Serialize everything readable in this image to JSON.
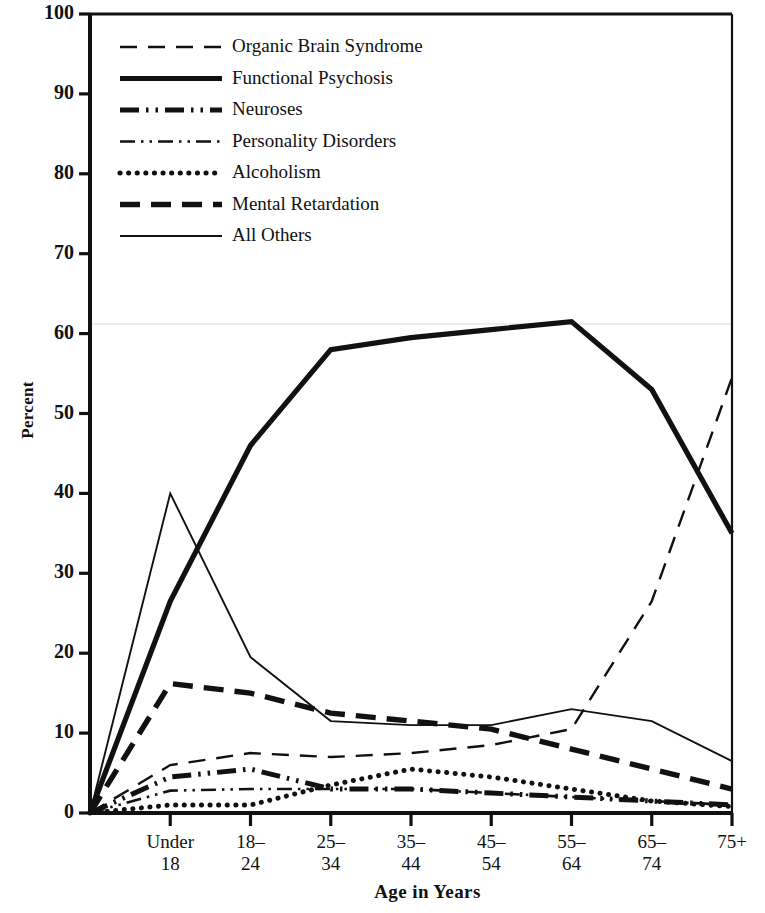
{
  "chart_data": {
    "type": "line",
    "title": "",
    "xlabel": "Age in Years",
    "ylabel": "Percent",
    "ylim": [
      0,
      100
    ],
    "yticks": [
      0,
      10,
      20,
      30,
      40,
      50,
      60,
      70,
      80,
      90,
      100
    ],
    "grid": false,
    "legend_position": "upper left",
    "categories": [
      "",
      "Under 18",
      "18–24",
      "25–34",
      "35–44",
      "45–54",
      "55–64",
      "65–74",
      "75+"
    ],
    "series": [
      {
        "name": "Organic Brain Syndrome",
        "style": "dashed",
        "values": [
          0,
          6.0,
          7.5,
          7.0,
          7.5,
          8.5,
          10.5,
          26.5,
          54.5
        ]
      },
      {
        "name": "Functional Psychosis",
        "style": "solid-thick",
        "values": [
          0,
          26.5,
          46.0,
          58.0,
          59.5,
          60.5,
          61.5,
          53.0,
          35.0
        ]
      },
      {
        "name": "Neuroses",
        "style": "dash-dot-dot-thick",
        "values": [
          0,
          4.5,
          5.5,
          3.0,
          3.0,
          2.5,
          2.0,
          1.5,
          1.0
        ]
      },
      {
        "name": "Personality Disorders",
        "style": "dash-dot-dot-thin",
        "values": [
          0,
          2.8,
          3.0,
          3.0,
          3.0,
          2.5,
          2.0,
          1.5,
          1.0
        ]
      },
      {
        "name": "Alcoholism",
        "style": "dotted",
        "values": [
          0,
          1.0,
          1.0,
          3.5,
          5.5,
          4.5,
          3.0,
          1.5,
          0.8
        ]
      },
      {
        "name": "Mental Retardation",
        "style": "dashed-thick",
        "values": [
          0,
          16.2,
          15.0,
          12.5,
          11.5,
          10.5,
          8.0,
          5.5,
          3.0
        ]
      },
      {
        "name": "All Others",
        "style": "solid-thin",
        "values": [
          0,
          40.0,
          19.5,
          11.5,
          11.0,
          11.0,
          13.0,
          11.5,
          6.5
        ]
      }
    ]
  },
  "axes": {
    "y_tick_labels": [
      "100",
      "90",
      "80",
      "70",
      "60",
      "50",
      "40",
      "30",
      "20",
      "10",
      "0"
    ],
    "y_axis_title": "Percent",
    "x_tick_labels": [
      {
        "line1": "Under",
        "line2": "18"
      },
      {
        "line1": "18–",
        "line2": "24"
      },
      {
        "line1": "25–",
        "line2": "34"
      },
      {
        "line1": "35–",
        "line2": "44"
      },
      {
        "line1": "45–",
        "line2": "54"
      },
      {
        "line1": "55–",
        "line2": "64"
      },
      {
        "line1": "65–",
        "line2": "74"
      },
      {
        "line1": "75+",
        "line2": ""
      }
    ],
    "x_axis_title": "Age in Years"
  },
  "legend": {
    "entries": [
      {
        "label": "Organic Brain Syndrome",
        "key": "organic-brain-syndrome"
      },
      {
        "label": "Functional Psychosis",
        "key": "functional-psychosis"
      },
      {
        "label": "Neuroses",
        "key": "neuroses"
      },
      {
        "label": "Personality Disorders",
        "key": "personality-disorders"
      },
      {
        "label": "Alcoholism",
        "key": "alcoholism"
      },
      {
        "label": "Mental Retardation",
        "key": "mental-retardation"
      },
      {
        "label": "All Others",
        "key": "all-others"
      }
    ]
  },
  "colors": {
    "ink": "#111111",
    "background": "#ffffff",
    "faint_gridline": "#d8d0c8"
  }
}
